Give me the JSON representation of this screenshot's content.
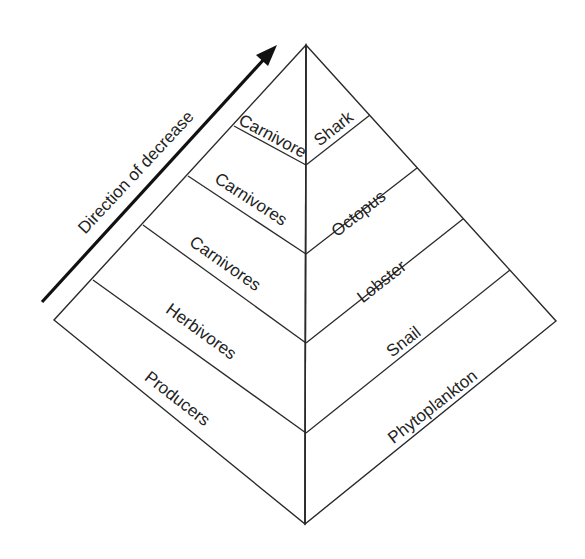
{
  "diagram": {
    "arrow_label": "Direction of decrease",
    "colors": {
      "line": "#2a2a2a",
      "left_fill": "#ffffff",
      "right_fill": "#c9c9c9",
      "text": "#222222"
    },
    "left_face": {
      "description": "Trophic levels",
      "levels": [
        {
          "label": "Carnivore"
        },
        {
          "label": "Carnivores"
        },
        {
          "label": "Carnivores"
        },
        {
          "label": "Herbivores"
        },
        {
          "label": "Producers"
        }
      ]
    },
    "right_face": {
      "description": "Example organisms",
      "levels": [
        {
          "label": "Shark"
        },
        {
          "label": "Octopus"
        },
        {
          "label": "Lobster"
        },
        {
          "label": "Snail"
        },
        {
          "label": "Phytoplankton"
        }
      ]
    }
  }
}
